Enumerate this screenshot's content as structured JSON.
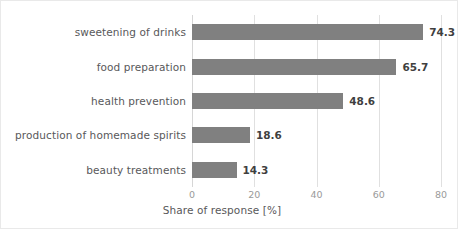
{
  "chart_data": {
    "type": "bar",
    "orientation": "horizontal",
    "title": "",
    "xlabel": "Share of response [%]",
    "ylabel": "",
    "categories": [
      "sweetening of drinks",
      "food preparation",
      "health prevention",
      "production of homemade spirits",
      "beauty treatments"
    ],
    "values": [
      74.3,
      65.7,
      48.6,
      18.6,
      14.3
    ],
    "value_labels": [
      "74.3",
      "65.7",
      "48.6",
      "18.6",
      "14.3"
    ],
    "xlim": [
      0,
      80
    ],
    "xticks": [
      0,
      20,
      40,
      60,
      80
    ],
    "xtick_labels": [
      "0",
      "20",
      "40",
      "60",
      "80"
    ],
    "grid": "vertical",
    "legend": "none",
    "bar_color": "#808080",
    "gridline_color": "#e0e0e0",
    "label_color": "#58585a",
    "tick_color": "#9a9a9a",
    "value_label_color": "#3f3f3f",
    "background_color": "#ffffff",
    "border_color": "#e9e9e9"
  }
}
